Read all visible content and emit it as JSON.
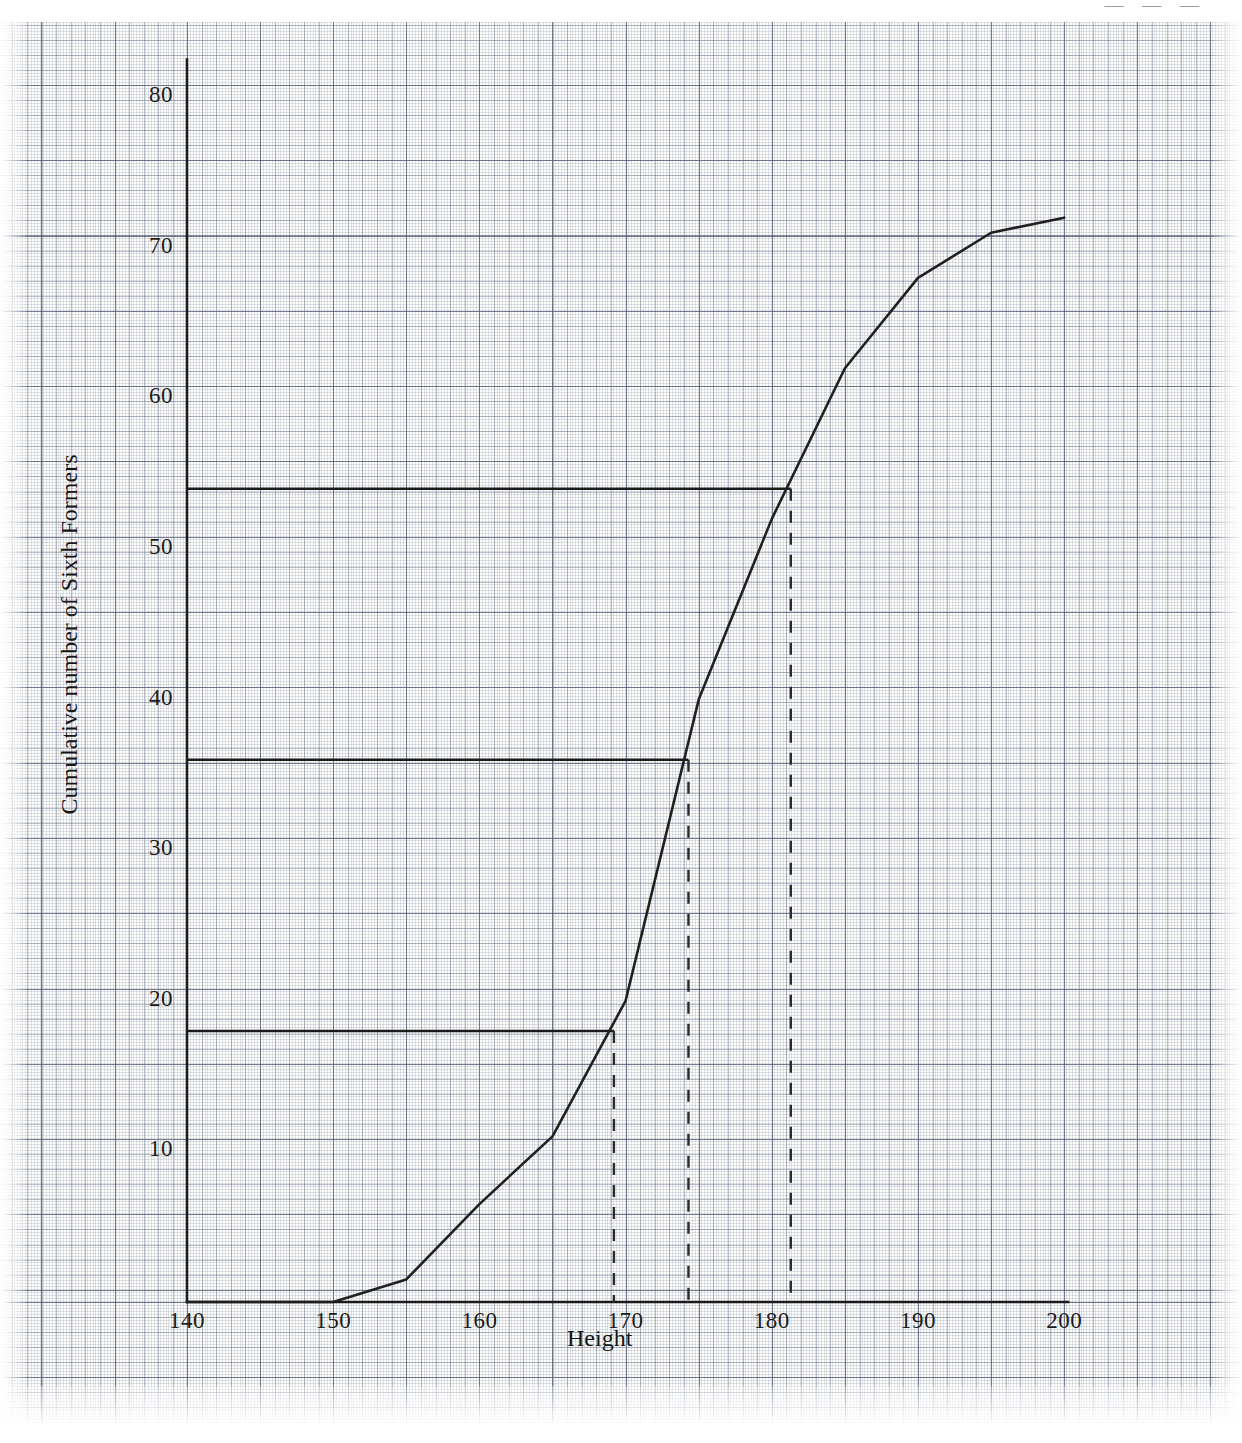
{
  "chart_data": {
    "type": "line",
    "title": "",
    "xlabel": "Height",
    "ylabel": "Cumulative number of Sixth Formers",
    "xlim": [
      140,
      200
    ],
    "ylim": [
      0,
      82
    ],
    "xticks": [
      140,
      150,
      160,
      170,
      180,
      190,
      200
    ],
    "yticks": [
      10,
      20,
      30,
      40,
      50,
      60,
      70,
      80
    ],
    "grid": true,
    "legend": null,
    "series": [
      {
        "name": "Cumulative frequency",
        "x": [
          140,
          150,
          155,
          160,
          165,
          170,
          175,
          180,
          185,
          190,
          195,
          200
        ],
        "y": [
          0,
          0,
          1.5,
          6.5,
          11,
          20,
          40,
          52,
          62,
          68,
          71,
          72
        ]
      }
    ],
    "annotations": [
      {
        "name": "lower-quartile",
        "type": "horizontal-marker",
        "y": 18,
        "x_from": 140,
        "x_to": 169.2,
        "drop_to_axis": true,
        "reading": 169.2
      },
      {
        "name": "median",
        "type": "horizontal-marker",
        "y": 36,
        "x_from": 140,
        "x_to": 174.3,
        "drop_to_axis": true,
        "reading": 174.3
      },
      {
        "name": "upper-quartile",
        "type": "horizontal-marker",
        "y": 54,
        "x_from": 140,
        "x_to": 181.3,
        "drop_to_axis": true,
        "reading": 181.3
      }
    ]
  },
  "axes": {
    "x_label": "Height",
    "y_label": "Cumulative number of Sixth Formers",
    "x_tick_labels": [
      "140",
      "150",
      "160",
      "170",
      "180",
      "190",
      "200"
    ],
    "y_tick_labels": [
      "10",
      "20",
      "30",
      "40",
      "50",
      "60",
      "70",
      "80"
    ]
  },
  "marks": {
    "corner_scribble": "— — —"
  },
  "colors": {
    "ink": "#1b1b1b",
    "curve": "#202020",
    "grid_major": "#46506a",
    "grid_minor": "#7a8496",
    "paper": "#fdfdfb"
  }
}
